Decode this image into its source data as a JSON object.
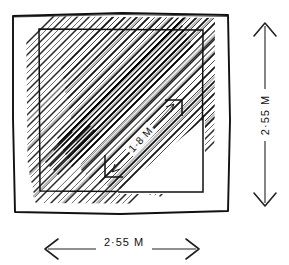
{
  "figure": {
    "type": "technical-drawing",
    "background_color": "#ffffff",
    "ink_color": "#111111"
  },
  "dimensions": {
    "horizontal": {
      "label": "2·55 M",
      "value": 2.55,
      "unit": "M",
      "orientation": "horizontal",
      "arrow_style": "double-open"
    },
    "vertical": {
      "label": "2·55 M",
      "value": 2.55,
      "unit": "M",
      "orientation": "vertical",
      "arrow_style": "double-open"
    },
    "diagonal": {
      "label": "1·8 M",
      "value": 1.8,
      "unit": "M",
      "orientation": "diagonal",
      "arrow_style": "double-arrow-with-corner-ticks"
    }
  },
  "shapes": {
    "outer_frame": {
      "name": "outer-square-border"
    },
    "inner_square": {
      "name": "inner-square-border"
    },
    "hatching": {
      "direction_a": "45deg-up-right",
      "direction_b": "45deg-up-left",
      "name": "diagonal-hatch-fill"
    }
  }
}
